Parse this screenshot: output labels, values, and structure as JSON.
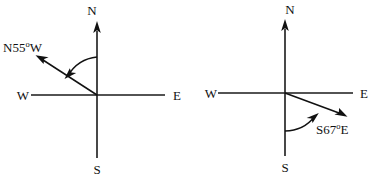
{
  "figure": {
    "background_color": "#ffffff",
    "stroke_color": "#111111",
    "diagrams": [
      {
        "id": "left",
        "name": "bearing-diagram-n55w",
        "center": {
          "x": 97,
          "y": 95
        },
        "axis_labels": {
          "north": "N",
          "south": "S",
          "east": "E",
          "west": "W"
        },
        "bearing": {
          "label_prefix": "N55",
          "label_degree": "o",
          "label_suffix": "W",
          "label_full": "N55oW",
          "from_axis": "N",
          "toward": "W",
          "angle_degrees": 55,
          "arrow_tip": {
            "x": 37,
            "y": 56
          }
        },
        "arc": {
          "from_axis": "N",
          "direction": "counterclockwise",
          "arrow_at": "ray"
        }
      },
      {
        "id": "right",
        "name": "bearing-diagram-s67e",
        "center": {
          "x": 285,
          "y": 93
        },
        "axis_labels": {
          "north": "N",
          "south": "S",
          "east": "E",
          "west": "W"
        },
        "bearing": {
          "label_prefix": "S67",
          "label_degree": "o",
          "label_suffix": "E",
          "label_full": "S67oE",
          "from_axis": "S",
          "toward": "E",
          "angle_degrees": 67,
          "arrow_tip": {
            "x": 345,
            "y": 117
          }
        },
        "arc": {
          "from_axis": "S",
          "direction": "clockwise",
          "arrow_at": "ray"
        }
      }
    ]
  }
}
